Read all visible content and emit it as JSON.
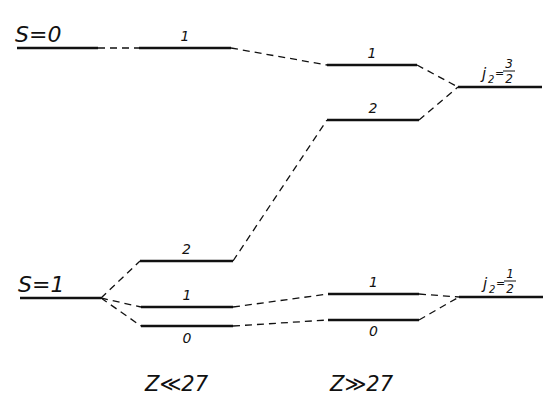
{
  "diagram": {
    "title": "",
    "colors": {
      "ink": "#111111",
      "background": "#ffffff"
    },
    "left_terms": [
      {
        "label": "S=0",
        "x1": 17,
        "x2": 98,
        "y": 48
      },
      {
        "label": "S=1",
        "x1": 20,
        "x2": 101,
        "y": 298
      }
    ],
    "middle_left_levels": [
      {
        "label": "1",
        "x1": 139,
        "x2": 231,
        "y": 48,
        "label_y": 41
      },
      {
        "label": "2",
        "x1": 140,
        "x2": 233,
        "y": 261,
        "label_y": 254
      },
      {
        "label": "1",
        "x1": 141,
        "x2": 233,
        "y": 307,
        "label_y": 300
      },
      {
        "label": "0",
        "x1": 141,
        "x2": 233,
        "y": 326,
        "label_y": 343
      }
    ],
    "middle_right_levels": [
      {
        "label": "1",
        "x1": 327,
        "x2": 417,
        "y": 65,
        "label_y": 58
      },
      {
        "label": "2",
        "x1": 327,
        "x2": 419,
        "y": 120,
        "label_y": 113
      },
      {
        "label": "1",
        "x1": 328,
        "x2": 419,
        "y": 294,
        "label_y": 287
      },
      {
        "label": "0",
        "x1": 328,
        "x2": 419,
        "y": 320,
        "label_y": 336
      }
    ],
    "right_terms": [
      {
        "label_prefix": "j",
        "subscript": "2",
        "numerator": "3",
        "denominator": "2",
        "x1": 458,
        "x2": 542,
        "y": 87
      },
      {
        "label_prefix": "j",
        "subscript": "2",
        "numerator": "1",
        "denominator": "2",
        "x1": 459,
        "x2": 543,
        "y": 297
      }
    ],
    "connectors": [
      {
        "from": [
          98,
          48
        ],
        "to": [
          139,
          48
        ]
      },
      {
        "from": [
          231,
          48
        ],
        "to": [
          327,
          65
        ]
      },
      {
        "from": [
          417,
          65
        ],
        "to": [
          458,
          87
        ]
      },
      {
        "from": [
          419,
          120
        ],
        "to": [
          458,
          87
        ]
      },
      {
        "from": [
          233,
          261
        ],
        "to": [
          327,
          120
        ]
      },
      {
        "from": [
          101,
          298
        ],
        "to": [
          140,
          261
        ]
      },
      {
        "from": [
          101,
          298
        ],
        "to": [
          141,
          307
        ]
      },
      {
        "from": [
          101,
          298
        ],
        "to": [
          141,
          326
        ]
      },
      {
        "from": [
          233,
          307
        ],
        "to": [
          328,
          294
        ]
      },
      {
        "from": [
          233,
          326
        ],
        "to": [
          328,
          320
        ]
      },
      {
        "from": [
          419,
          294
        ],
        "to": [
          459,
          297
        ]
      },
      {
        "from": [
          419,
          320
        ],
        "to": [
          459,
          297
        ]
      }
    ],
    "bottom_labels": [
      {
        "text": "Z≪27",
        "x": 145,
        "y": 391
      },
      {
        "text": "Z≫27",
        "x": 330,
        "y": 391
      }
    ]
  }
}
